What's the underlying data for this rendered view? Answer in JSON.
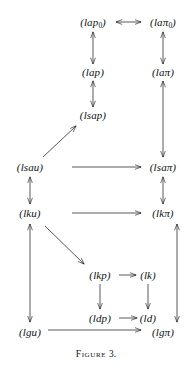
{
  "figure": {
    "caption_label": "Figure",
    "caption_number": "3.",
    "caption_full": "Figure 3.",
    "width": 192,
    "height": 373,
    "ink_color": "#111111",
    "background_color": "#ffffff"
  },
  "nodes": [
    {
      "id": "lap0",
      "text": "(lap",
      "sub": "0",
      "close": ")",
      "x": 93,
      "y": 22,
      "label": "(lap_0)"
    },
    {
      "id": "lapi0",
      "text": "(laπ",
      "sub": "0",
      "close": ")",
      "x": 163,
      "y": 22,
      "label": "(laπ_0)"
    },
    {
      "id": "lap",
      "text": "(lap)",
      "sub": "",
      "close": "",
      "x": 93,
      "y": 72,
      "label": "(lap)"
    },
    {
      "id": "lapi",
      "text": "(laπ)",
      "sub": "",
      "close": "",
      "x": 163,
      "y": 72,
      "label": "(laπ)"
    },
    {
      "id": "lsap",
      "text": "(lsap)",
      "sub": "",
      "close": "",
      "x": 93,
      "y": 115,
      "label": "(lsap)"
    },
    {
      "id": "lsau",
      "text": "(lsau)",
      "sub": "",
      "close": "",
      "x": 30,
      "y": 167,
      "label": "(lsau)"
    },
    {
      "id": "lsapi",
      "text": "(lsaπ)",
      "sub": "",
      "close": "",
      "x": 163,
      "y": 167,
      "label": "(lsaπ)"
    },
    {
      "id": "lku",
      "text": "(lku)",
      "sub": "",
      "close": "",
      "x": 30,
      "y": 213,
      "label": "(lku)"
    },
    {
      "id": "lkpi",
      "text": "(lkπ)",
      "sub": "",
      "close": "",
      "x": 163,
      "y": 213,
      "label": "(lkπ)"
    },
    {
      "id": "lkp",
      "text": "(lkp)",
      "sub": "",
      "close": "",
      "x": 100,
      "y": 275,
      "label": "(lkp)"
    },
    {
      "id": "lk",
      "text": "(lk)",
      "sub": "",
      "close": "",
      "x": 148,
      "y": 275,
      "label": "(lk)"
    },
    {
      "id": "ldp",
      "text": "(ldp)",
      "sub": "",
      "close": "",
      "x": 100,
      "y": 318,
      "label": "(ldp)"
    },
    {
      "id": "ld",
      "text": "(ld)",
      "sub": "",
      "close": "",
      "x": 148,
      "y": 318,
      "label": "(ld)"
    },
    {
      "id": "lgu",
      "text": "(lgu)",
      "sub": "",
      "close": "",
      "x": 30,
      "y": 332,
      "label": "(lgu)"
    },
    {
      "id": "lgpi",
      "text": "(lgπ)",
      "sub": "",
      "close": "",
      "x": 163,
      "y": 332,
      "label": "(lgπ)"
    }
  ],
  "edges": [
    {
      "id": "lap0-lapi0",
      "from": "lap0",
      "to": "lapi0",
      "heads": "both",
      "x1": 116,
      "y1": 22,
      "x2": 141,
      "y2": 22
    },
    {
      "id": "lap-lap0",
      "from": "lap",
      "to": "lap0",
      "heads": "both",
      "x1": 93,
      "y1": 64,
      "x2": 93,
      "y2": 32
    },
    {
      "id": "lapi-lapi0",
      "from": "lapi",
      "to": "lapi0",
      "heads": "both",
      "x1": 163,
      "y1": 64,
      "x2": 163,
      "y2": 32
    },
    {
      "id": "lsap-lap",
      "from": "lsap",
      "to": "lap",
      "heads": "both",
      "x1": 93,
      "y1": 107,
      "x2": 93,
      "y2": 81
    },
    {
      "id": "lsau-lsap",
      "from": "lsau",
      "to": "lsap",
      "heads": "end",
      "x1": 43,
      "y1": 157,
      "x2": 76,
      "y2": 126
    },
    {
      "id": "lsau-lsapi",
      "from": "lsau",
      "to": "lsapi",
      "heads": "end",
      "x1": 72,
      "y1": 167,
      "x2": 141,
      "y2": 167
    },
    {
      "id": "lapi-lsapi",
      "from": "lapi",
      "to": "lsapi",
      "heads": "both",
      "x1": 163,
      "y1": 81,
      "x2": 163,
      "y2": 157
    },
    {
      "id": "lku-lsau",
      "from": "lku",
      "to": "lsau",
      "heads": "both",
      "x1": 30,
      "y1": 204,
      "x2": 30,
      "y2": 177
    },
    {
      "id": "lku-lkpi",
      "from": "lku",
      "to": "lkpi",
      "heads": "end",
      "x1": 72,
      "y1": 213,
      "x2": 141,
      "y2": 213
    },
    {
      "id": "lkpi-lsapi",
      "from": "lkpi",
      "to": "lsapi",
      "heads": "both",
      "x1": 163,
      "y1": 204,
      "x2": 163,
      "y2": 177
    },
    {
      "id": "lku-lkp",
      "from": "lku",
      "to": "lkp",
      "heads": "end",
      "x1": 45,
      "y1": 226,
      "x2": 84,
      "y2": 264
    },
    {
      "id": "lku-lgu",
      "from": "lku",
      "to": "lgu",
      "heads": "both",
      "x1": 30,
      "y1": 224,
      "x2": 30,
      "y2": 322
    },
    {
      "id": "lkp-lk",
      "from": "lkp",
      "to": "lk",
      "heads": "end",
      "x1": 119,
      "y1": 275,
      "x2": 136,
      "y2": 275
    },
    {
      "id": "lkp-ldp",
      "from": "lkp",
      "to": "ldp",
      "heads": "end",
      "x1": 100,
      "y1": 284,
      "x2": 100,
      "y2": 309
    },
    {
      "id": "lk-ld",
      "from": "lk",
      "to": "ld",
      "heads": "end",
      "x1": 148,
      "y1": 284,
      "x2": 148,
      "y2": 309
    },
    {
      "id": "ldp-ld",
      "from": "ldp",
      "to": "ld",
      "heads": "end",
      "x1": 119,
      "y1": 318,
      "x2": 137,
      "y2": 318
    },
    {
      "id": "lkpi-lgpi",
      "from": "lkpi",
      "to": "lgpi",
      "heads": "both",
      "x1": 177,
      "y1": 224,
      "x2": 177,
      "y2": 322
    },
    {
      "id": "lgu-lgpi",
      "from": "lgu",
      "to": "lgpi",
      "heads": "end",
      "x1": 48,
      "y1": 330,
      "x2": 141,
      "y2": 330
    }
  ]
}
